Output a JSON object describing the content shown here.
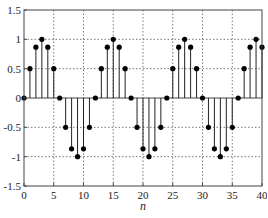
{
  "chart_data": {
    "type": "stem",
    "title": "",
    "xlabel": "n",
    "ylabel": "",
    "xlim": [
      0,
      40
    ],
    "ylim": [
      -1.5,
      1.5
    ],
    "grid": true,
    "grid_style": "dotted",
    "xticks": [
      0,
      5,
      10,
      15,
      20,
      25,
      30,
      35,
      40
    ],
    "xtick_labels": [
      "0",
      "5",
      "10",
      "15",
      "20",
      "25",
      "30",
      "35",
      "40"
    ],
    "yticks": [
      1.5,
      1,
      0.5,
      0,
      -0.5,
      -1,
      -1.5
    ],
    "ytick_labels": [
      "1.5",
      "1",
      "0.5",
      "0",
      "-0.5",
      "-1",
      "-1.5"
    ],
    "series": [
      {
        "name": "x[n] = sin(2πn/12)",
        "marker": "filled-circle",
        "color": "#000000",
        "x": [
          0,
          1,
          2,
          3,
          4,
          5,
          6,
          7,
          8,
          9,
          10,
          11,
          12,
          13,
          14,
          15,
          16,
          17,
          18,
          19,
          20,
          21,
          22,
          23,
          24,
          25,
          26,
          27,
          28,
          29,
          30,
          31,
          32,
          33,
          34,
          35,
          36,
          37,
          38,
          39,
          40
        ],
        "values": [
          0,
          0.5,
          0.866,
          1,
          0.866,
          0.5,
          0,
          -0.5,
          -0.866,
          -1,
          -0.866,
          -0.5,
          0,
          0.5,
          0.866,
          1,
          0.866,
          0.5,
          0,
          -0.5,
          -0.866,
          -1,
          -0.866,
          -0.5,
          0,
          0.5,
          0.866,
          1,
          0.866,
          0.5,
          0,
          -0.5,
          -0.866,
          -1,
          -0.866,
          -0.5,
          0,
          0.5,
          0.866,
          1,
          0.866
        ]
      }
    ]
  },
  "layout": {
    "plot_left": 24,
    "plot_right": 262,
    "plot_top": 10,
    "plot_bottom": 186
  },
  "colors": {
    "axis": "#444444",
    "grid": "#555555",
    "stem": "#222222",
    "marker": "#000000"
  }
}
